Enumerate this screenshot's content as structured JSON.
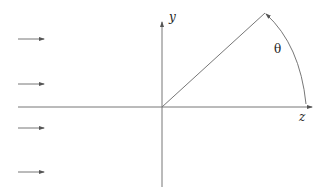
{
  "diagram": {
    "title": "",
    "labels": {
      "y_axis": "y",
      "z_axis": "z",
      "angle": "θ"
    },
    "colors": {
      "line": "#6e6e6e",
      "text": "#222222",
      "background": "#ffffff"
    },
    "origin": [
      162,
      107
    ],
    "y_axis": {
      "x": 162,
      "y_top": 22,
      "y_bottom": 187
    },
    "z_axis": {
      "y": 107,
      "x_left": 18,
      "x_right": 312
    },
    "radial_line": {
      "from": [
        162,
        107
      ],
      "to": [
        265,
        13
      ]
    },
    "arc": {
      "from": [
        306,
        107
      ],
      "to": [
        266,
        13
      ],
      "arrow_at": "top"
    },
    "incident_arrows": [
      {
        "y": 39,
        "x1": 18,
        "x2": 44
      },
      {
        "y": 84,
        "x1": 18,
        "x2": 44
      },
      {
        "y": 128,
        "x1": 18,
        "x2": 44
      },
      {
        "y": 172,
        "x1": 18,
        "x2": 44
      }
    ]
  }
}
